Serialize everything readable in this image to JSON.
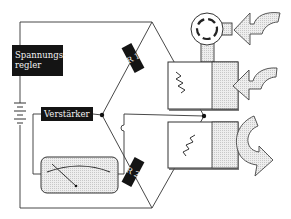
{
  "diagram": {
    "type": "circuit-schematic",
    "labels": {
      "voltage_regulator": "Spannungs-\nregler",
      "voltage_regulator_line1": "Spannungs-",
      "voltage_regulator_line2": "regler",
      "amplifier": "Verstärker",
      "resistor_1": "R 1",
      "resistor_2": "R 2"
    },
    "components": [
      {
        "id": "voltage-regulator",
        "label": "Spannungsregler"
      },
      {
        "id": "battery",
        "label": ""
      },
      {
        "id": "amplifier",
        "label": "Verstärker"
      },
      {
        "id": "resistor-r1",
        "label": "R 1"
      },
      {
        "id": "resistor-r2",
        "label": "R 2"
      },
      {
        "id": "meter",
        "label": ""
      },
      {
        "id": "heated-resistor-upper",
        "label": ""
      },
      {
        "id": "heated-resistor-lower",
        "label": ""
      },
      {
        "id": "fan-turbine",
        "label": ""
      },
      {
        "id": "airflow-arrow-top",
        "label": ""
      },
      {
        "id": "airflow-arrow-middle",
        "label": ""
      },
      {
        "id": "airflow-arrow-return",
        "label": ""
      }
    ],
    "colors": {
      "line": "#333333",
      "box_fill": "#141414",
      "box_text": "#f2f2f2",
      "arrow_fill": "#e8e8e8",
      "shade_fill": "#dcdcdc"
    }
  }
}
